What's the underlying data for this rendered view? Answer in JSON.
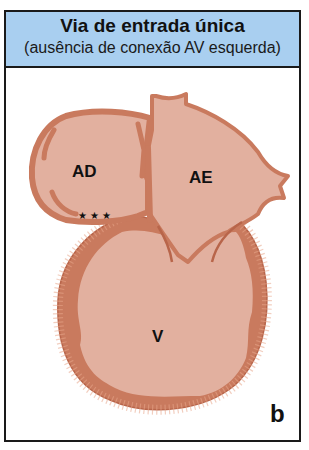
{
  "header": {
    "title": "Via de entrada única",
    "subtitle": "(ausência de conexão AV esquerda)"
  },
  "labels": {
    "right_atrium": "AD",
    "left_atrium": "AE",
    "ventricle": "V",
    "absent_connection_marker": "★★★"
  },
  "panel_letter": "b",
  "colors": {
    "header_bg": "#a9cff0",
    "cavity": "#e2b09f",
    "wall": "#c97a5e",
    "wall_dark": "#b8654a",
    "border": "#1a1a1a"
  }
}
